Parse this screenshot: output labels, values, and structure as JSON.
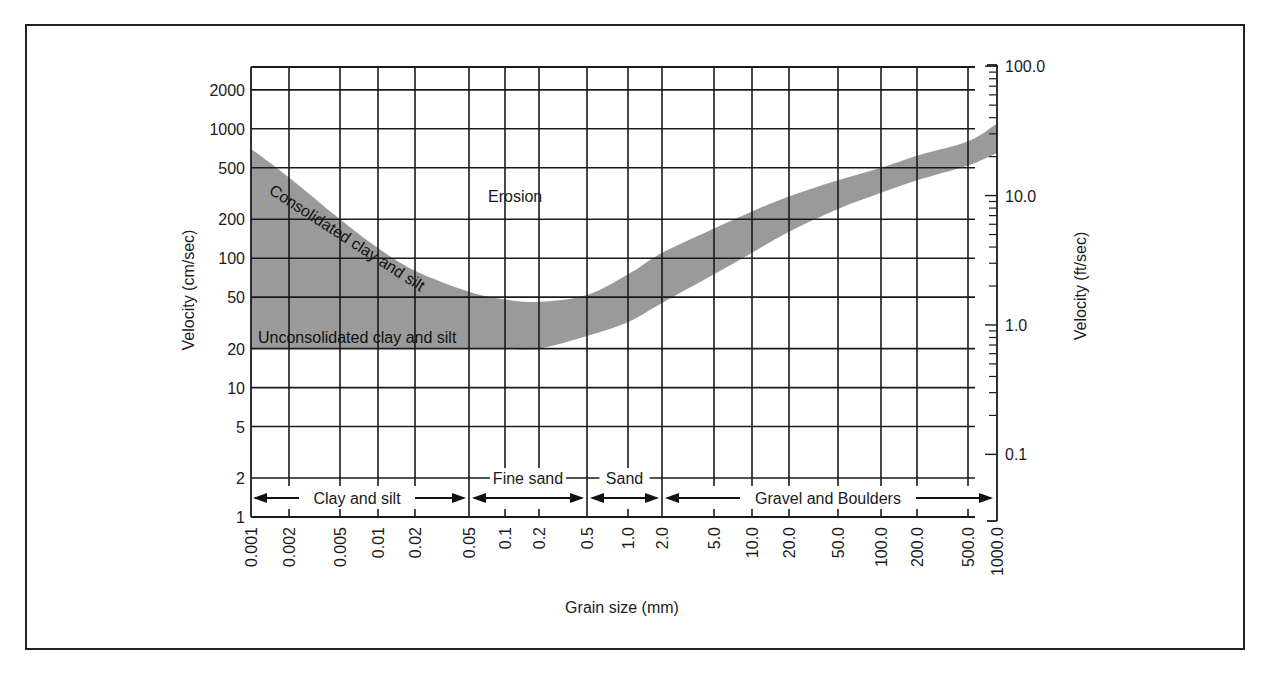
{
  "chart_data": {
    "type": "area",
    "title": "",
    "xlabel": "Grain size (mm)",
    "ylabel": "Velocity (cm/sec)",
    "ylabel_right": "Velocity (ft/sec)",
    "x_scale": "log",
    "y_scale": "log",
    "xlim": [
      0.001,
      1000.0
    ],
    "ylim": [
      1,
      3000
    ],
    "grid": true,
    "x_ticks": [
      "0.001",
      "0.002",
      "0.005",
      "0.01",
      "0.02",
      "0.05",
      "0.1",
      "0.2",
      "0.5",
      "1.0",
      "2.0",
      "5.0",
      "10.0",
      "20.0",
      "50.0",
      "100.0",
      "200.0",
      "500.0",
      "1000.0"
    ],
    "y_ticks_left": [
      "1",
      "2",
      "5",
      "10",
      "20",
      "50",
      "100",
      "200",
      "500",
      "1000",
      "2000"
    ],
    "y_ticks_right": [
      "0.1",
      "1.0",
      "10.0",
      "100.0"
    ],
    "region_label": "Erosion",
    "band": {
      "name": "Erosion threshold band",
      "fill": "#9a9a9a",
      "upper": {
        "x": [
          0.001,
          0.002,
          0.005,
          0.01,
          0.02,
          0.05,
          0.1,
          0.2,
          0.5,
          1.0,
          2.0,
          5.0,
          10.0,
          20.0,
          50.0,
          100.0,
          200.0,
          500.0,
          1000.0
        ],
        "y": [
          700,
          420,
          200,
          120,
          80,
          55,
          48,
          46,
          52,
          75,
          110,
          170,
          230,
          300,
          400,
          500,
          620,
          800,
          1100
        ]
      },
      "lower": {
        "x": [
          0.001,
          0.002,
          0.005,
          0.01,
          0.02,
          0.05,
          0.1,
          0.2,
          0.5,
          1.0,
          2.0,
          5.0,
          10.0,
          20.0,
          50.0,
          100.0,
          200.0,
          500.0,
          1000.0
        ],
        "y": [
          20,
          20,
          20,
          20,
          20,
          20,
          20,
          20,
          25,
          32,
          45,
          75,
          110,
          160,
          240,
          320,
          400,
          520,
          650
        ]
      },
      "labels": [
        "Consolidated clay and silt",
        "Unconsolidated clay and silt"
      ]
    },
    "size_classes": [
      {
        "label": "Clay and silt",
        "from": "0.001",
        "to": "0.05"
      },
      {
        "label": "Fine sand",
        "from": "0.05",
        "to": "0.5"
      },
      {
        "label": "Sand",
        "from": "0.5",
        "to": "2.0"
      },
      {
        "label": "Gravel and Boulders",
        "from": "2.0",
        "to": "1000.0"
      }
    ]
  },
  "labels": {
    "erosion": "Erosion",
    "consolidated": "Consolidated clay and silt",
    "unconsolidated": "Unconsolidated clay and silt",
    "xlabel": "Grain size (mm)",
    "ylabel_left": "Velocity (cm/sec)",
    "ylabel_right": "Velocity (ft/sec)",
    "class_clay": "Clay and silt",
    "class_fine_sand": "Fine sand",
    "class_sand": "Sand",
    "class_gravel": "Gravel and Boulders"
  }
}
